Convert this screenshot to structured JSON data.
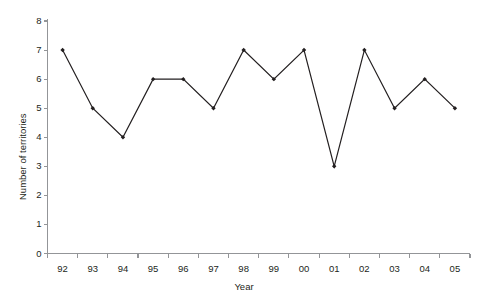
{
  "chart_data": {
    "type": "line",
    "title": "",
    "xlabel": "Year",
    "ylabel": "Number of territories",
    "categories": [
      "92",
      "93",
      "94",
      "95",
      "96",
      "97",
      "98",
      "99",
      "00",
      "01",
      "02",
      "03",
      "04",
      "05"
    ],
    "values": [
      7,
      5,
      4,
      6,
      6,
      5,
      7,
      6,
      7,
      3,
      7,
      5,
      6,
      5
    ],
    "series": [
      {
        "name": "Number of territories",
        "values": [
          7,
          5,
          4,
          6,
          6,
          5,
          7,
          6,
          7,
          3,
          7,
          5,
          6,
          5
        ]
      }
    ],
    "ylim": [
      0,
      8
    ],
    "y_ticks": [
      "0",
      "1",
      "2",
      "3",
      "4",
      "5",
      "6",
      "7",
      "8"
    ],
    "y_tick_values": [
      0,
      1,
      2,
      3,
      4,
      5,
      6,
      7,
      8
    ],
    "grid": false,
    "legend": false,
    "legend_position": "none",
    "marker": "diamond",
    "line_color": "#231f20",
    "marker_color": "#231f20",
    "axis_color": "#939598",
    "background_color": "#ffffff"
  }
}
